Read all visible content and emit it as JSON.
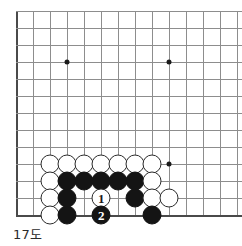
{
  "caption": "17도",
  "board": {
    "name": "go-board-diagram",
    "origin_x": 16,
    "origin_y": 11,
    "spacing": 17,
    "cols": 13,
    "rows": 13,
    "left_edge_col": 0,
    "top_edge_row": 0,
    "bottom_edge_row": 12,
    "grid_color": "#8d8d8d",
    "edge_color": "#4a4a4a",
    "black_color": "#141414",
    "white_color": "#ffffff",
    "star_points": [
      {
        "col": 3,
        "row": 3
      },
      {
        "col": 9,
        "row": 3
      },
      {
        "col": 9,
        "row": 9
      }
    ],
    "stones": [
      {
        "col": 2,
        "row": 9,
        "color": "white",
        "label": ""
      },
      {
        "col": 3,
        "row": 9,
        "color": "white",
        "label": ""
      },
      {
        "col": 4,
        "row": 9,
        "color": "white",
        "label": ""
      },
      {
        "col": 5,
        "row": 9,
        "color": "white",
        "label": ""
      },
      {
        "col": 6,
        "row": 9,
        "color": "white",
        "label": ""
      },
      {
        "col": 7,
        "row": 9,
        "color": "white",
        "label": ""
      },
      {
        "col": 8,
        "row": 9,
        "color": "white",
        "label": ""
      },
      {
        "col": 2,
        "row": 10,
        "color": "white",
        "label": ""
      },
      {
        "col": 3,
        "row": 10,
        "color": "black",
        "label": ""
      },
      {
        "col": 4,
        "row": 10,
        "color": "black",
        "label": ""
      },
      {
        "col": 5,
        "row": 10,
        "color": "black",
        "label": ""
      },
      {
        "col": 6,
        "row": 10,
        "color": "black",
        "label": ""
      },
      {
        "col": 7,
        "row": 10,
        "color": "black",
        "label": ""
      },
      {
        "col": 8,
        "row": 10,
        "color": "white",
        "label": ""
      },
      {
        "col": 2,
        "row": 11,
        "color": "white",
        "label": ""
      },
      {
        "col": 3,
        "row": 11,
        "color": "black",
        "label": ""
      },
      {
        "col": 5,
        "row": 11,
        "color": "white",
        "label": "1"
      },
      {
        "col": 7,
        "row": 11,
        "color": "black",
        "label": ""
      },
      {
        "col": 8,
        "row": 11,
        "color": "white",
        "label": ""
      },
      {
        "col": 9,
        "row": 11,
        "color": "white",
        "label": ""
      },
      {
        "col": 2,
        "row": 12,
        "color": "white",
        "label": ""
      },
      {
        "col": 3,
        "row": 12,
        "color": "black",
        "label": ""
      },
      {
        "col": 5,
        "row": 12,
        "color": "black",
        "label": "2"
      },
      {
        "col": 8,
        "row": 12,
        "color": "black",
        "label": ""
      }
    ]
  }
}
